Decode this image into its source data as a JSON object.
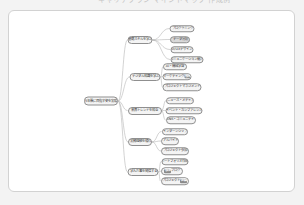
{
  "header": {
    "clipped_text": "キャリアプラン マインドマップ 作成例"
  },
  "colors": {
    "page_bg": "#f3f3f3",
    "card_bg": "#ffffff",
    "card_border": "#d2d2d2",
    "node_fill": "#f4f4f4",
    "node_fill_dark": "#d9d9d9",
    "node_border": "#8f8f8f",
    "node_text": "#333333",
    "connector": "#b5b5b5",
    "highlight_bg": "#8a8a8a",
    "highlight_text": "#ffffff"
  },
  "mindmap": {
    "root_id": "root",
    "nodes": [
      {
        "id": "root",
        "label": "5年後に目指す姿を実現",
        "x": 101,
        "y": 101,
        "w": 34,
        "h": 9,
        "root": true
      },
      {
        "id": "b1",
        "label": "基礎スキルを学ぶ",
        "x": 140,
        "y": 40,
        "w": 25,
        "h": 8
      },
      {
        "id": "b1c1",
        "label": "プログラミング",
        "x": 182,
        "y": 28.5,
        "w": 25,
        "h": 7.5
      },
      {
        "id": "b1c2",
        "label": "データ分析",
        "x": 180,
        "y": 39.5,
        "w": 20,
        "h": 7.5,
        "dark": true
      },
      {
        "id": "b1c3",
        "label": "UI/UXデザイン",
        "x": 181.5,
        "y": 49.5,
        "w": 23,
        "h": 7.5
      },
      {
        "id": "b1c4",
        "label": "コミュニケーション能力",
        "x": 186.5,
        "y": 59.5,
        "w": 33,
        "h": 7.5
      },
      {
        "id": "b2",
        "label": "デジタル知識を学ぶ",
        "x": 145,
        "y": 77,
        "w": 31,
        "h": 8
      },
      {
        "id": "b2c1",
        "label": "AI・機械学習",
        "x": 175,
        "y": 66.5,
        "w": 24,
        "h": 7.5
      },
      {
        "id": "b2c2",
        "label": "マーケティング戦略",
        "x": 177,
        "y": 76.5,
        "w": 29,
        "h": 7.5,
        "parts": [
          {
            "t": "マーケティング"
          },
          {
            "t": "戦略",
            "strong": true
          }
        ]
      },
      {
        "id": "b2c3",
        "label": "プロジェクトマネジメント",
        "x": 182,
        "y": 87,
        "w": 39,
        "h": 7.5
      },
      {
        "id": "b3",
        "label": "業界トレンドを知る",
        "x": 144.5,
        "y": 110.5,
        "w": 34,
        "h": 8
      },
      {
        "id": "b3c1",
        "label": "ニュース・メディア",
        "x": 180,
        "y": 100.5,
        "w": 28,
        "h": 7.5
      },
      {
        "id": "b3c2",
        "label": "イベント・カンファレンス",
        "x": 184,
        "y": 110.5,
        "w": 37,
        "h": 7.5
      },
      {
        "id": "b3c3",
        "label": "SNS・コミュニティ",
        "x": 180.5,
        "y": 120,
        "w": 30,
        "h": 7.5
      },
      {
        "id": "b4",
        "label": "実務経験を積む",
        "x": 140,
        "y": 142,
        "w": 24,
        "h": 8
      },
      {
        "id": "b4c1",
        "label": "インターンシップ",
        "x": 174.5,
        "y": 131.5,
        "w": 26,
        "h": 7.5
      },
      {
        "id": "b4c2",
        "label": "アルバイト",
        "x": 170,
        "y": 141,
        "w": 18,
        "h": 7.5
      },
      {
        "id": "b4c3",
        "label": "プロジェクト参加",
        "x": 175,
        "y": 151,
        "w": 28,
        "h": 7.5
      },
      {
        "id": "b5",
        "label": "学んだ事を発信する",
        "x": 143,
        "y": 172,
        "w": 31,
        "h": 8
      },
      {
        "id": "b5c1",
        "label": "ポートフォリオ作成",
        "x": 174.5,
        "y": 161.5,
        "w": 27,
        "h": 7.5
      },
      {
        "id": "b5c2",
        "label": "執筆 ブログ",
        "x": 172,
        "y": 171,
        "w": 22,
        "h": 7.5,
        "parts": [
          {
            "t": "執筆",
            "strong": true
          },
          {
            "t": " ブログ"
          }
        ]
      },
      {
        "id": "b5c3",
        "label": "プロジェクト記録",
        "x": 174.5,
        "y": 181,
        "w": 28,
        "h": 7.5,
        "parts": [
          {
            "t": "プロジェクト"
          },
          {
            "t": "記録",
            "strong": true
          }
        ]
      }
    ],
    "edges": [
      [
        "root",
        "b1"
      ],
      [
        "root",
        "b2"
      ],
      [
        "root",
        "b3"
      ],
      [
        "root",
        "b4"
      ],
      [
        "root",
        "b5"
      ],
      [
        "b1",
        "b1c1"
      ],
      [
        "b1",
        "b1c2"
      ],
      [
        "b1",
        "b1c3"
      ],
      [
        "b1",
        "b1c4"
      ],
      [
        "b2",
        "b2c1"
      ],
      [
        "b2",
        "b2c2"
      ],
      [
        "b2",
        "b2c3"
      ],
      [
        "b3",
        "b3c1"
      ],
      [
        "b3",
        "b3c2"
      ],
      [
        "b3",
        "b3c3"
      ],
      [
        "b4",
        "b4c1"
      ],
      [
        "b4",
        "b4c2"
      ],
      [
        "b4",
        "b4c3"
      ],
      [
        "b5",
        "b5c1"
      ],
      [
        "b5",
        "b5c2"
      ],
      [
        "b5",
        "b5c3"
      ]
    ]
  }
}
